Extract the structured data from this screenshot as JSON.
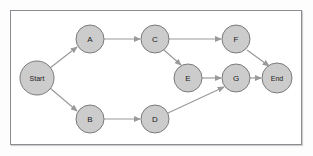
{
  "figure": {
    "background_color": "#fdfdfd",
    "frame_color": "#8b8b91",
    "node_fill": "#cccccc",
    "node_stroke": "#7a7a7a",
    "edge_color": "#9a9a9a",
    "label_color": "#1b1b1b"
  },
  "nodes": [
    {
      "id": "start",
      "label": "Start",
      "cx": 37,
      "cy": 78,
      "r": 17,
      "label_size": "small"
    },
    {
      "id": "a",
      "label": "A",
      "cx": 90,
      "cy": 39,
      "r": 14,
      "label_size": "letter"
    },
    {
      "id": "b",
      "label": "B",
      "cx": 90,
      "cy": 119,
      "r": 14,
      "label_size": "letter"
    },
    {
      "id": "c",
      "label": "C",
      "cx": 155,
      "cy": 39,
      "r": 14,
      "label_size": "letter"
    },
    {
      "id": "d",
      "label": "D",
      "cx": 155,
      "cy": 119,
      "r": 14,
      "label_size": "letter"
    },
    {
      "id": "e",
      "label": "E",
      "cx": 188,
      "cy": 78,
      "r": 14,
      "label_size": "letter"
    },
    {
      "id": "f",
      "label": "F",
      "cx": 236,
      "cy": 39,
      "r": 14,
      "label_size": "letter"
    },
    {
      "id": "g",
      "label": "G",
      "cx": 236,
      "cy": 78,
      "r": 14,
      "label_size": "letter"
    },
    {
      "id": "end",
      "label": "End",
      "cx": 277,
      "cy": 78,
      "r": 15,
      "label_size": "small"
    }
  ],
  "edges": [
    {
      "from": "start",
      "to": "a",
      "x1": 50,
      "y1": 68,
      "x2": 77,
      "y2": 47
    },
    {
      "from": "start",
      "to": "b",
      "x1": 50,
      "y1": 88,
      "x2": 77,
      "y2": 111
    },
    {
      "from": "a",
      "to": "c",
      "x1": 104,
      "y1": 39,
      "x2": 140,
      "y2": 39
    },
    {
      "from": "c",
      "to": "f",
      "x1": 169,
      "y1": 39,
      "x2": 221,
      "y2": 39
    },
    {
      "from": "c",
      "to": "e",
      "x1": 164,
      "y1": 50,
      "x2": 181,
      "y2": 65
    },
    {
      "from": "b",
      "to": "d",
      "x1": 104,
      "y1": 119,
      "x2": 140,
      "y2": 119
    },
    {
      "from": "d",
      "to": "g",
      "x1": 168,
      "y1": 113,
      "x2": 224,
      "y2": 87
    },
    {
      "from": "e",
      "to": "g",
      "x1": 202,
      "y1": 78,
      "x2": 221,
      "y2": 78
    },
    {
      "from": "f",
      "to": "end",
      "x1": 247,
      "y1": 50,
      "x2": 269,
      "y2": 66
    },
    {
      "from": "g",
      "to": "end",
      "x1": 250,
      "y1": 78,
      "x2": 261,
      "y2": 78
    }
  ]
}
